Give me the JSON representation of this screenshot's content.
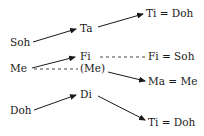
{
  "nodes": {
    "soh": "Soh",
    "ta": "Ta",
    "ti_doh_top": "Ti = Doh",
    "me": "Me",
    "fi": "Fi",
    "fi_soh": "Fi = Soh",
    "me_paren": "(Me)",
    "ma_me": "Ma = Me",
    "doh": "Doh",
    "di": "Di",
    "ti_doh_bottom": "Ti = Doh"
  },
  "links": [
    {
      "from": "soh",
      "to": "ta",
      "style": "arrow"
    },
    {
      "from": "ta",
      "to": "ti_doh_top",
      "style": "arrow"
    },
    {
      "from": "me",
      "to": "fi",
      "style": "arrow"
    },
    {
      "from": "fi",
      "to": "fi_soh",
      "style": "dashed"
    },
    {
      "from": "me",
      "to": "me_paren",
      "style": "dashed"
    },
    {
      "from": "me_paren",
      "to": "ma_me",
      "style": "arrow"
    },
    {
      "from": "doh",
      "to": "di",
      "style": "arrow"
    },
    {
      "from": "di",
      "to": "ti_doh_bottom",
      "style": "arrow"
    }
  ],
  "colors": {
    "ink": "#1a1a1a"
  }
}
